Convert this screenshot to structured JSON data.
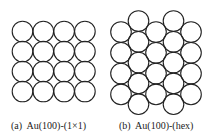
{
  "panels": [
    {
      "id": "a",
      "label": "(a)  Au(100)-(1×1)",
      "structure": "square",
      "rows": 4,
      "cols": 4,
      "origin": [
        22.5,
        31.5
      ],
      "dx": 20.8,
      "dy": 20,
      "r": 10.3
    },
    {
      "id": "b",
      "label": "(b)  Au(100)-(hex)",
      "structure": "hexagonal",
      "columns": [
        {
          "x": 121,
          "y0": 32,
          "count": 4
        },
        {
          "x": 138.5,
          "y0": 21,
          "count": 5
        },
        {
          "x": 156,
          "y0": 32,
          "count": 4
        },
        {
          "x": 173.5,
          "y0": 21,
          "count": 5
        },
        {
          "x": 191,
          "y0": 32,
          "count": 4
        }
      ],
      "dy": 20.8,
      "r": 10.3
    }
  ],
  "colors": {
    "stroke": "#222222",
    "background": "#ffffff"
  }
}
